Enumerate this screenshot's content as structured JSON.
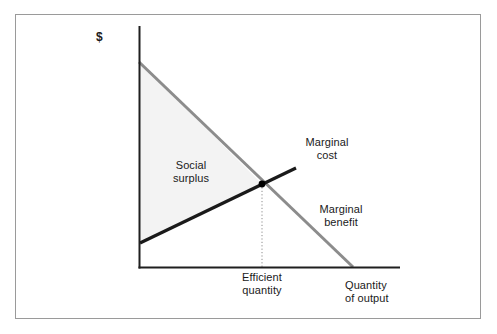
{
  "figure": {
    "domain": "diagram",
    "type": "economics-line-diagram",
    "background_color": "#ffffff",
    "border_color": "#9a9a9a"
  },
  "axes": {
    "y_axis_label": "$",
    "x_axis_label_line1": "Quantity",
    "x_axis_label_line2": "of output",
    "origin": {
      "x": 139,
      "y": 268
    },
    "y_axis_top": {
      "x": 139,
      "y": 26
    },
    "x_axis_right": {
      "x": 400,
      "y": 268
    },
    "axis_color": "#1f1f1f"
  },
  "curves": [
    {
      "name": "marginal-benefit",
      "label_line1": "Marginal",
      "label_line2": "benefit",
      "color": "#8c8c8c",
      "width": 3,
      "start": {
        "x": 139,
        "y": 62
      },
      "end": {
        "x": 353,
        "y": 267
      },
      "slope": "downward"
    },
    {
      "name": "marginal-cost",
      "label_line1": "Marginal",
      "label_line2": "cost",
      "color": "#1a1a1a",
      "width": 3.2,
      "start": {
        "x": 140,
        "y": 243
      },
      "end": {
        "x": 296,
        "y": 168
      },
      "slope": "upward"
    }
  ],
  "equilibrium": {
    "name": "efficient-quantity",
    "label_line1": "Efficient",
    "label_line2": "quantity",
    "point": {
      "x": 262,
      "y": 184
    },
    "dot_color": "#000000",
    "dot_radius": 3.4,
    "dropline_color": "#8c8c8c",
    "dropline_to_y": 268
  },
  "shaded_region": {
    "name": "social-surplus",
    "label_line1": "Social",
    "label_line2": "surplus",
    "fill_color": "#f3f3f3",
    "vertices": [
      {
        "x": 139,
        "y": 62
      },
      {
        "x": 262,
        "y": 184
      },
      {
        "x": 140,
        "y": 243
      }
    ]
  }
}
